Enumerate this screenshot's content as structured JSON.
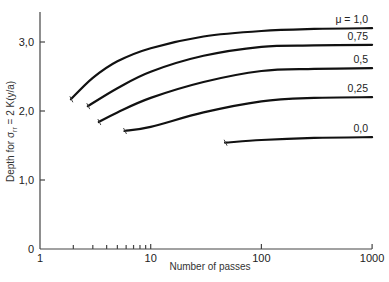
{
  "chart_data": {
    "type": "line",
    "title": "",
    "xlabel": "Number of passes",
    "ylabel": "Depth for σ_rr = 2 K(y/a)",
    "xscale": "log",
    "xlim": [
      1,
      1000
    ],
    "ylim": [
      0,
      3.5
    ],
    "x_ticks": [
      "1",
      "10",
      "100",
      "1000"
    ],
    "y_ticks": [
      "0",
      "1,0",
      "2,0",
      "3,0"
    ],
    "grid": false,
    "legend": "inline labels at right end of curves",
    "series": [
      {
        "name": "μ = 1,0",
        "x": [
          1.9,
          3,
          5,
          10,
          30,
          100,
          300,
          1000
        ],
        "y": [
          2.17,
          2.48,
          2.72,
          2.91,
          3.08,
          3.16,
          3.19,
          3.2
        ]
      },
      {
        "name": "0,75",
        "x": [
          2.7,
          5,
          10,
          30,
          100,
          300,
          1000
        ],
        "y": [
          2.07,
          2.33,
          2.57,
          2.8,
          2.93,
          2.95,
          2.96
        ]
      },
      {
        "name": "0,5",
        "x": [
          3.4,
          5,
          10,
          30,
          100,
          300,
          1000
        ],
        "y": [
          1.84,
          1.98,
          2.19,
          2.42,
          2.58,
          2.61,
          2.62
        ]
      },
      {
        "name": "0,25",
        "x": [
          5.8,
          10,
          30,
          100,
          300,
          1000
        ],
        "y": [
          1.71,
          1.77,
          1.98,
          2.14,
          2.19,
          2.2
        ]
      },
      {
        "name": "0,0",
        "x": [
          47,
          100,
          300,
          1000
        ],
        "y": [
          1.54,
          1.58,
          1.61,
          1.62
        ]
      }
    ]
  },
  "labels": {
    "xlabel": "Number of passes",
    "ylabel_prefix": "Depth for σ",
    "ylabel_sub": "rr",
    "ylabel_suffix": " = 2 K(y/a)",
    "x_ticks": [
      "1",
      "10",
      "100",
      "1000"
    ],
    "y_ticks": [
      "0",
      "1,0",
      "2,0",
      "3,0"
    ],
    "curve_labels": [
      "μ = 1,0",
      "0,75",
      "0,5",
      "0,25",
      "0,0"
    ]
  }
}
